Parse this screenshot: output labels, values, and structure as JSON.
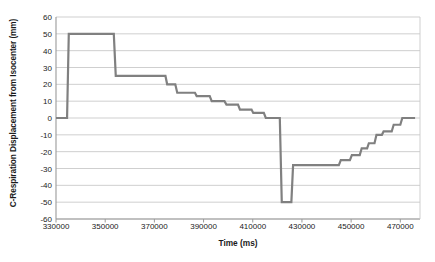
{
  "chart_data": {
    "type": "line",
    "title": "",
    "xlabel": "Time  (ms)",
    "ylabel": "C-Respiration Displacement from Isocenter (mm)",
    "xlim": [
      330000,
      478000
    ],
    "ylim": [
      -60,
      60
    ],
    "xticks": [
      330000,
      350000,
      370000,
      390000,
      410000,
      430000,
      450000,
      470000
    ],
    "xtick_labels": [
      "330000",
      "350000",
      "370000",
      "390000",
      "410000",
      "430000",
      "450000",
      "470000"
    ],
    "yticks": [
      60,
      50,
      40,
      30,
      20,
      10,
      0,
      -10,
      -20,
      -30,
      -40,
      -50,
      -60
    ],
    "ytick_labels": [
      "60",
      "50",
      "40",
      "30",
      "20",
      "10",
      "0",
      "-10",
      "-20",
      "-30",
      "-40",
      "-50",
      "-60"
    ],
    "grid": true,
    "grid_color": "#c9c9c9",
    "legend": false,
    "line_color": "#808080",
    "line_width": 2.2,
    "series": [
      {
        "name": "C-Respiration Displacement",
        "x": [
          330000,
          334500,
          335200,
          336000,
          353500,
          354300,
          354900,
          374500,
          375200,
          378500,
          379300,
          386500,
          387200,
          392500,
          393300,
          398500,
          399300,
          404000,
          404800,
          409500,
          410200,
          414500,
          415300,
          419000,
          419900,
          421000,
          421800,
          424500,
          425200,
          425700,
          426400,
          445000,
          445800,
          449500,
          450300,
          453500,
          454300,
          456500,
          457200,
          459500,
          460300,
          462500,
          463200,
          466500,
          467300,
          470000,
          470800,
          476000
        ],
        "y": [
          0,
          0,
          50,
          50,
          50,
          25,
          25,
          25,
          20,
          20,
          15,
          15,
          13,
          13,
          10,
          10,
          8,
          8,
          5,
          5,
          3,
          3,
          0,
          0,
          0,
          0,
          -50,
          -50,
          -50,
          -50,
          -28,
          -28,
          -25,
          -25,
          -22,
          -22,
          -18,
          -18,
          -15,
          -15,
          -10,
          -10,
          -8,
          -8,
          -4,
          -4,
          0,
          0
        ]
      }
    ]
  },
  "axes": {
    "plot_left_px": 56,
    "plot_right_px": 420,
    "plot_top_px": 17,
    "plot_bottom_px": 219
  }
}
